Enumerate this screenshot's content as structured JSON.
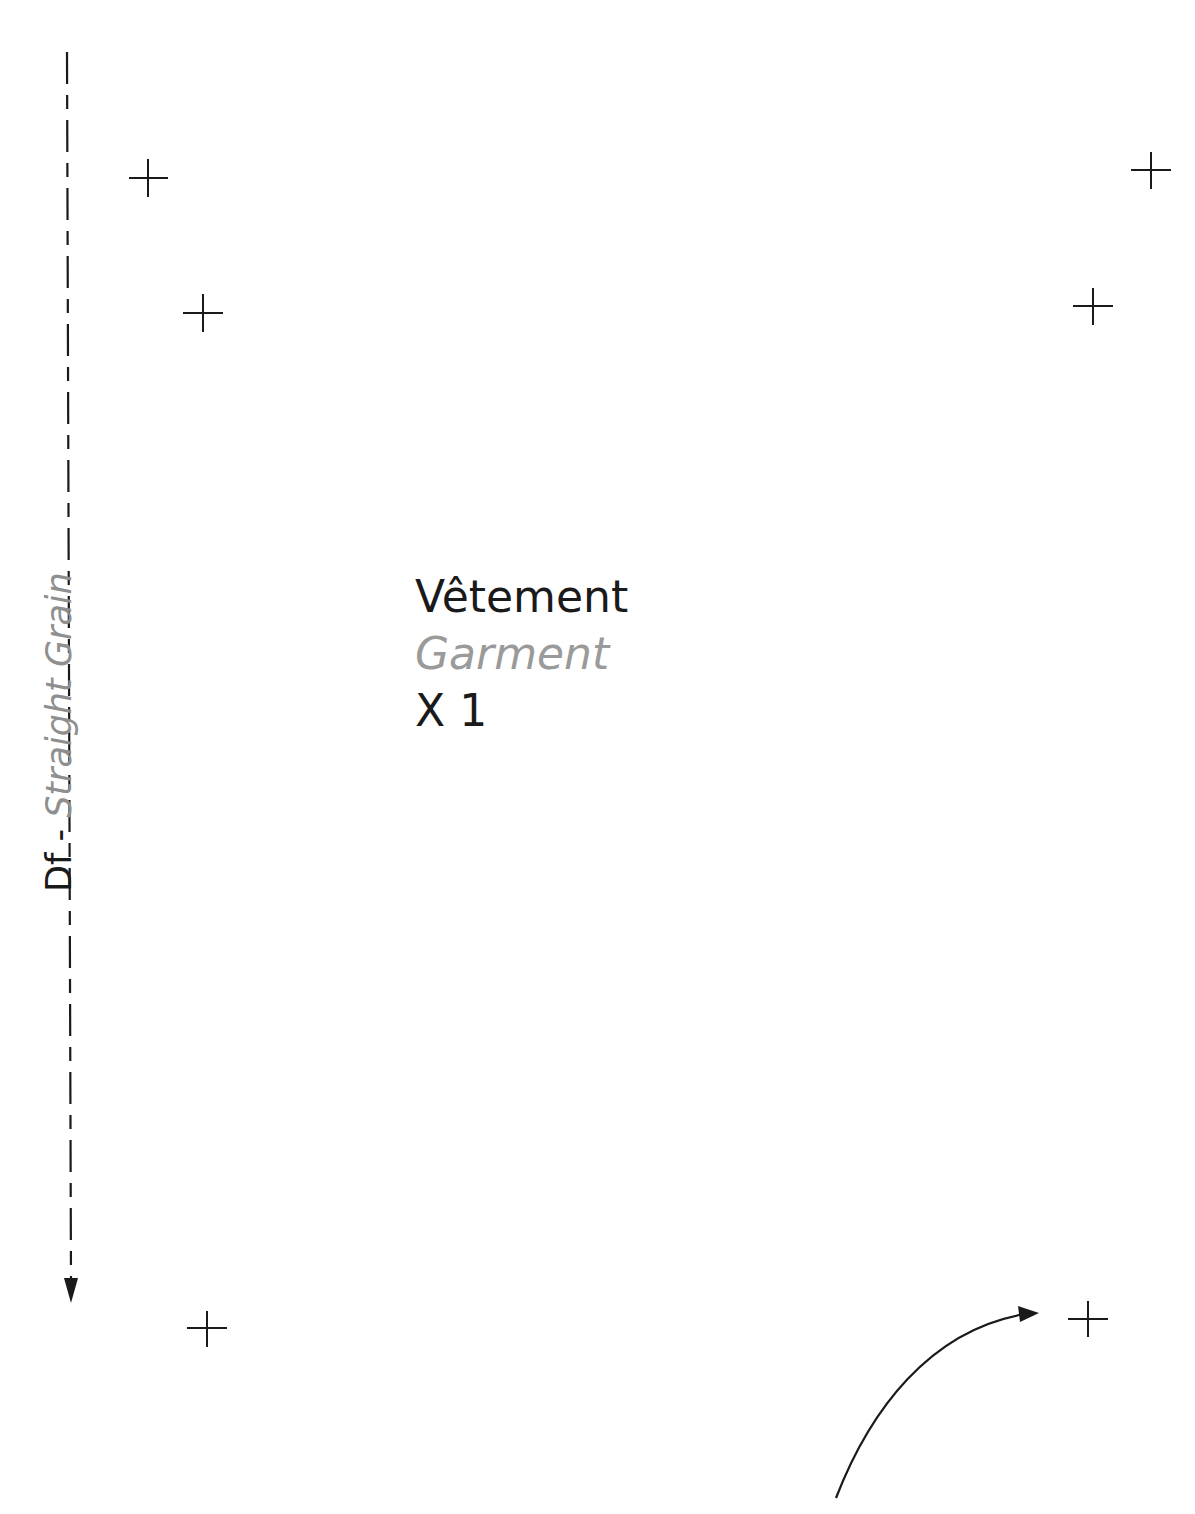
{
  "grainline": {
    "primary_label": "Df - ",
    "secondary_label": "Straight Grain",
    "direction": "down",
    "x": 68,
    "y_start": 52,
    "y_end": 1302
  },
  "piece_label": {
    "name_fr": "Vêtement",
    "name_en": "Garment",
    "quantity": "X 1"
  },
  "marks": [
    {
      "id": "mark-top-left-outer",
      "x": 148,
      "y": 178
    },
    {
      "id": "mark-top-left-inner",
      "x": 203,
      "y": 313
    },
    {
      "id": "mark-top-right-outer",
      "x": 1151,
      "y": 170
    },
    {
      "id": "mark-top-right-inner",
      "x": 1093,
      "y": 306
    },
    {
      "id": "mark-bottom-left",
      "x": 207,
      "y": 1328
    },
    {
      "id": "mark-bottom-right",
      "x": 1088,
      "y": 1319
    }
  ],
  "curved_arrow": {
    "start": [
      836,
      1498
    ],
    "end": [
      1037,
      1313
    ]
  },
  "colors": {
    "ink": "#1a1a1a",
    "secondary_text": "#9a9a9a",
    "background": "#ffffff"
  }
}
